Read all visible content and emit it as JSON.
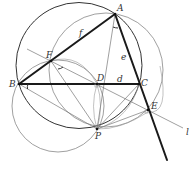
{
  "diagram": {
    "type": "geometry",
    "points": {
      "A": {
        "label": "A",
        "x": 115,
        "y": 14
      },
      "B": {
        "label": "B",
        "x": 19,
        "y": 84
      },
      "C": {
        "label": "C",
        "x": 139,
        "y": 84
      },
      "D": {
        "label": "D",
        "x": 97,
        "y": 84
      },
      "E": {
        "label": "E",
        "x": 148,
        "y": 110
      },
      "F": {
        "label": "F",
        "x": 51,
        "y": 61
      },
      "P": {
        "label": "P",
        "x": 97,
        "y": 129
      }
    },
    "segment_labels": {
      "f": "f",
      "e": "e",
      "d": "d"
    },
    "line_label": "l",
    "circles": [
      {
        "name": "circumcircle-ABC",
        "cx": 79,
        "cy": 65.5,
        "r": 63
      },
      {
        "name": "circle-AFE",
        "cx": 106,
        "cy": 70,
        "r": 57
      },
      {
        "name": "circle-BFDP",
        "cx": 58,
        "cy": 106,
        "r": 46
      }
    ]
  }
}
